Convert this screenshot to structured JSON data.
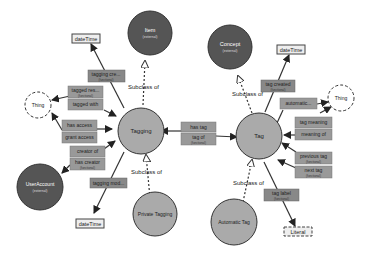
{
  "colors": {
    "class_fill": "#aaaaaa",
    "external_fill": "#555555",
    "property_fill": "#999999",
    "datatype_fill": "#eeeeee",
    "datatype_border": "#555555",
    "edge": "#333333",
    "text": "#222222",
    "text_light": "#ffffff"
  },
  "nodes": {
    "tagging": {
      "label": "Tagging"
    },
    "tag": {
      "label": "Tag"
    },
    "item": {
      "label": "Item",
      "sub": "(external)"
    },
    "concept": {
      "label": "Concept",
      "sub": "(external)"
    },
    "useraccount": {
      "label": "UserAccount",
      "sub": "(external)"
    },
    "private_tagging": {
      "label": "Private Tagging"
    },
    "automatic_tag": {
      "label": "Automatic Tag"
    },
    "thing_left": {
      "label": "Thing"
    },
    "thing_right": {
      "label": "Thing"
    },
    "datetime_top_left": {
      "label": "dateTime"
    },
    "datetime_bottom_left": {
      "label": "dateTime"
    },
    "datetime_right": {
      "label": "dateTime"
    },
    "literal": {
      "label": "Literal"
    }
  },
  "properties": {
    "tagging_created": {
      "label": "tagging cre...",
      "sub": "(functional)"
    },
    "tagged_resource": {
      "label": "tagged res...",
      "sub": "(functional)"
    },
    "tagged_with": {
      "label": "tagged with"
    },
    "has_access": {
      "label": "has access"
    },
    "grant_access": {
      "label": "grant access"
    },
    "creator_of": {
      "label": "creator of"
    },
    "has_creator": {
      "label": "has creator",
      "sub": "(functional)"
    },
    "tagging_modified": {
      "label": "tagging mod..."
    },
    "has_tag": {
      "label": "has tag"
    },
    "tag_of": {
      "label": "tag of",
      "sub": "(functional)"
    },
    "tag_created": {
      "label": "tag created",
      "sub": "(functional)"
    },
    "automatic": {
      "label": "automatic..."
    },
    "tag_meaning": {
      "label": "tag meaning"
    },
    "meaning_of": {
      "label": "meaning of"
    },
    "previous_tag": {
      "label": "previous tag",
      "sub": "(functional)"
    },
    "next_tag": {
      "label": "next tag",
      "sub": "(functional)"
    },
    "tag_label": {
      "label": "tag label",
      "sub": "(functional)"
    }
  },
  "edges": {
    "subclass_item": "Subclass of",
    "subclass_private": "Subclass of",
    "subclass_concept": "Subclass of",
    "subclass_automatic": "Subclass of"
  }
}
